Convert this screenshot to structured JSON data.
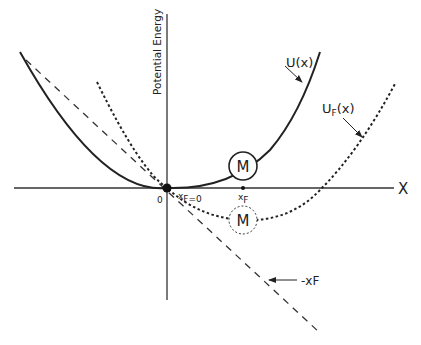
{
  "diagram": {
    "y_axis_label": "Potential Energy",
    "x_axis_label": "X",
    "origin_label": "0",
    "xF0_label_main": "x",
    "xF0_label_sub": "F=0",
    "xF_label_main": "x",
    "xF_label_sub": "F",
    "U_label": "U(x)",
    "UF_label_main": "U",
    "UF_label_sub": "F",
    "UF_label_tail": "(x)",
    "mass_label": "M",
    "mass_shifted_label": "M",
    "force_line_label": "-xF",
    "colors": {
      "ink": "#222222",
      "background": "#ffffff"
    }
  }
}
